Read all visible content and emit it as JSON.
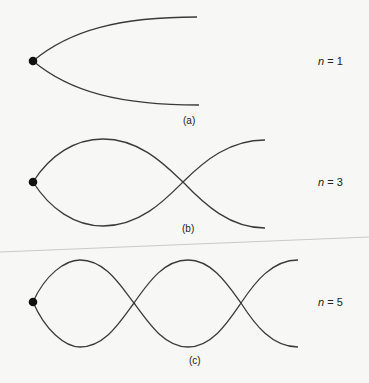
{
  "panels": [
    {
      "label": "(a)",
      "n_var": "n",
      "n_text": " = 1",
      "harmonic": 1
    },
    {
      "label": "(b)",
      "n_var": "n",
      "n_text": " = 3",
      "harmonic": 3
    },
    {
      "label": "(c)",
      "n_var": "n",
      "n_text": " = 5",
      "harmonic": 5
    }
  ],
  "colors": {
    "line": "#3a3a3a",
    "dot": "#111111",
    "background": "#f7f7f5"
  }
}
